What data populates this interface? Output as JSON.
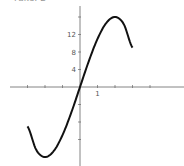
{
  "header": {
    "cut_text": "Fake: 2"
  },
  "chart_data": {
    "type": "line",
    "title": "",
    "xlabel": "",
    "ylabel": "",
    "function": "y = 12x - x^3",
    "x": [
      -3,
      -2.5,
      -2,
      -1.5,
      -1,
      -0.5,
      0,
      0.5,
      1,
      1.5,
      2,
      2.5,
      3
    ],
    "series": [
      {
        "name": "f(x)",
        "values": [
          -9,
          -14.375,
          -16,
          -14.625,
          -11,
          -5.875,
          0,
          5.875,
          11,
          14.625,
          16,
          14.375,
          9
        ]
      }
    ],
    "xlim": [
      -4,
      5
    ],
    "ylim": [
      -16,
      18
    ],
    "x_ticks": [
      -3,
      -2,
      -1,
      1,
      2,
      3,
      4
    ],
    "x_tick_labels": [
      "",
      "",
      "",
      "1",
      "",
      "",
      ""
    ],
    "y_ticks": [
      -12,
      -8,
      -4,
      4,
      8,
      12,
      16
    ],
    "y_tick_labels": [
      "",
      "",
      "",
      "4",
      "8",
      "12",
      ""
    ],
    "grid": false,
    "legend": "none",
    "colors": {
      "curve": "#111111",
      "axes": "#666666"
    }
  }
}
